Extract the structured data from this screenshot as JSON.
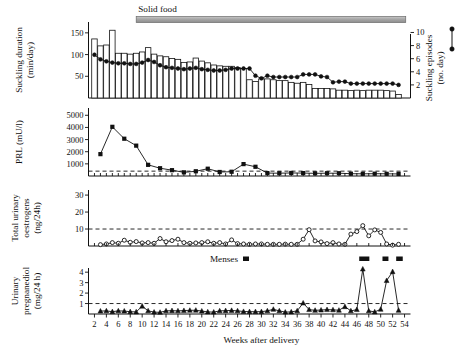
{
  "figure": {
    "xaxis": {
      "label": "Weeks after delivery",
      "ticks": [
        2,
        4,
        6,
        8,
        10,
        12,
        14,
        16,
        18,
        20,
        22,
        24,
        26,
        28,
        30,
        32,
        34,
        36,
        38,
        40,
        42,
        44,
        46,
        48,
        50,
        52,
        54
      ],
      "min": 1,
      "max": 55
    },
    "annotations": {
      "solid_food": "Solid food",
      "menses": "Menses",
      "menses_symbol": "filled-square"
    },
    "panels": [
      {
        "id": "suckling",
        "ylabel_lines": [
          "Suckling duration",
          "(min/day)"
        ],
        "yticks": [
          50,
          100,
          150
        ],
        "ylim": [
          0,
          175
        ],
        "right_ylabel_lines": [
          "Suckling episodes",
          "(no. day)"
        ],
        "right_yticks": [
          2,
          4,
          6,
          8,
          10
        ],
        "right_ylim": [
          0,
          11.6
        ]
      },
      {
        "id": "prl",
        "ylabel_lines": [
          "PRL (mU/l)"
        ],
        "yticks": [
          1000,
          2000,
          3000,
          4000,
          5000
        ],
        "ylim": [
          0,
          5600
        ],
        "threshold": 400
      },
      {
        "id": "oestrogens",
        "ylabel_lines": [
          "Total urinary",
          "oestrogens",
          "(ng/24h)"
        ],
        "yticks": [
          10,
          20,
          30
        ],
        "ylim": [
          0,
          33
        ],
        "threshold": 10
      },
      {
        "id": "pregnanediol",
        "ylabel_lines": [
          "Urinary",
          "pregnanediol",
          "(mg/24 h)"
        ],
        "yticks": [
          1,
          2,
          3,
          4
        ],
        "ylim": [
          0,
          4.4
        ],
        "threshold": 1
      }
    ]
  },
  "chart_data": [
    {
      "type": "bar",
      "title": "Suckling duration (min/day)",
      "xlabel": "Weeks after delivery",
      "ylabel": "Suckling duration (min/day)",
      "ylim": [
        0,
        175
      ],
      "x": [
        2,
        3,
        4,
        5,
        6,
        7,
        8,
        9,
        10,
        11,
        12,
        13,
        14,
        15,
        16,
        17,
        18,
        19,
        20,
        21,
        22,
        23,
        24,
        25,
        26,
        27,
        28,
        29,
        30,
        31,
        32,
        33,
        34,
        35,
        36,
        37,
        38,
        39,
        40,
        41,
        42,
        43,
        44,
        45,
        46,
        47,
        48,
        49,
        50,
        51,
        52,
        53
      ],
      "values": [
        136,
        120,
        122,
        156,
        103,
        103,
        101,
        103,
        106,
        116,
        101,
        97,
        95,
        91,
        89,
        82,
        83,
        92,
        85,
        81,
        76,
        74,
        73,
        73,
        70,
        68,
        42,
        38,
        44,
        44,
        42,
        40,
        40,
        36,
        34,
        36,
        31,
        22,
        22,
        22,
        21,
        18,
        18,
        17,
        18,
        17,
        18,
        18,
        18,
        17,
        16,
        8
      ]
    },
    {
      "type": "line",
      "title": "Suckling episodes (no./day)",
      "xlabel": "Weeks after delivery",
      "ylabel": "Suckling episodes (no. day)",
      "ylim": [
        0,
        11.6
      ],
      "x": [
        2,
        3,
        4,
        5,
        6,
        7,
        8,
        9,
        10,
        11,
        12,
        13,
        14,
        15,
        16,
        17,
        18,
        19,
        20,
        21,
        22,
        23,
        24,
        25,
        26,
        27,
        28,
        29,
        30,
        31,
        32,
        33,
        34,
        35,
        36,
        37,
        38,
        39,
        40,
        41,
        42,
        43,
        44,
        45,
        46,
        47,
        48,
        49,
        50,
        51,
        52,
        53
      ],
      "values": [
        6.6,
        5.9,
        5.6,
        5.4,
        5.3,
        5.3,
        5.2,
        5.2,
        5.4,
        5.8,
        5.5,
        5.0,
        4.7,
        4.6,
        4.5,
        4.4,
        4.5,
        4.6,
        4.4,
        4.3,
        4.2,
        4.2,
        4.3,
        4.5,
        4.5,
        4.5,
        4.5,
        3.4,
        3.0,
        3.4,
        3.2,
        3.2,
        3.2,
        3.2,
        3.2,
        3.6,
        3.6,
        3.6,
        3.3,
        3.2,
        2.4,
        2.5,
        2.5,
        2.2,
        2.2,
        2.2,
        2.2,
        2.2,
        2.2,
        2.2,
        2.2,
        2.0
      ]
    },
    {
      "type": "line",
      "title": "PRL (mU/l)",
      "xlabel": "Weeks after delivery",
      "ylabel": "PRL (mU/l)",
      "ylim": [
        0,
        5600
      ],
      "x": [
        3,
        5,
        7,
        9,
        11,
        13,
        15,
        17,
        19,
        21,
        23,
        25,
        27,
        29,
        31,
        33,
        35,
        37,
        39,
        41,
        43,
        45,
        47,
        49,
        51,
        53
      ],
      "values": [
        1800,
        4050,
        3070,
        2500,
        920,
        640,
        480,
        300,
        390,
        600,
        330,
        350,
        980,
        760,
        240,
        230,
        250,
        240,
        220,
        230,
        230,
        190,
        180,
        190,
        180,
        170
      ],
      "threshold": 400
    },
    {
      "type": "line",
      "title": "Total urinary oestrogens (ng/24h)",
      "xlabel": "Weeks after delivery",
      "ylabel": "Total urinary oestrogens (ng/24h)",
      "ylim": [
        0,
        33
      ],
      "x": [
        3,
        4,
        5,
        6,
        7,
        8,
        9,
        10,
        11,
        12,
        13,
        14,
        15,
        16,
        17,
        18,
        19,
        20,
        21,
        22,
        23,
        24,
        25,
        26,
        27,
        28,
        29,
        30,
        31,
        32,
        33,
        34,
        35,
        36,
        37,
        38,
        39,
        40,
        41,
        42,
        43,
        44,
        45,
        46,
        47,
        48,
        49,
        50,
        51,
        52,
        53
      ],
      "values": [
        0.8,
        1.2,
        2.0,
        1.6,
        3.4,
        2.2,
        2.6,
        1.8,
        2.0,
        1.6,
        4.4,
        2.5,
        3.2,
        4.0,
        2.0,
        1.6,
        1.8,
        2.0,
        2.5,
        1.6,
        2.0,
        1.2,
        3.6,
        1.4,
        1.2,
        1.0,
        1.2,
        1.2,
        1.0,
        1.0,
        1.0,
        1.1,
        1.0,
        1.0,
        4.0,
        9.6,
        3.0,
        2.4,
        1.4,
        2.0,
        1.2,
        1.0,
        7.0,
        8.5,
        12.0,
        6.0,
        9.5,
        8.0,
        1.2,
        0.5,
        1.0
      ],
      "threshold": 10,
      "marker": "open-circle"
    },
    {
      "type": "line",
      "title": "Urinary pregnanediol (mg/24 h)",
      "xlabel": "Weeks after delivery",
      "ylabel": "Urinary pregnanediol (mg/24 h)",
      "ylim": [
        0,
        4.4
      ],
      "x": [
        3,
        4,
        5,
        6,
        7,
        8,
        9,
        10,
        11,
        12,
        13,
        14,
        15,
        16,
        17,
        18,
        19,
        20,
        21,
        22,
        23,
        24,
        25,
        26,
        27,
        28,
        29,
        30,
        31,
        32,
        33,
        34,
        35,
        36,
        37,
        38,
        39,
        40,
        41,
        42,
        43,
        44,
        45,
        46,
        47,
        48,
        49,
        50,
        51,
        52,
        53
      ],
      "values": [
        0.28,
        0.3,
        0.22,
        0.3,
        0.28,
        0.22,
        0.2,
        0.75,
        0.3,
        0.18,
        0.16,
        0.3,
        0.32,
        0.3,
        0.33,
        0.35,
        0.36,
        0.28,
        0.2,
        0.18,
        0.3,
        0.32,
        0.34,
        0.3,
        0.24,
        0.22,
        0.22,
        0.22,
        0.3,
        0.45,
        0.3,
        0.18,
        0.2,
        0.3,
        1.05,
        0.42,
        0.35,
        0.38,
        0.42,
        0.4,
        0.36,
        0.7,
        0.3,
        0.42,
        4.3,
        0.3,
        0.2,
        0.45,
        3.2,
        4.05,
        0.35
      ],
      "threshold": 1,
      "marker": "filled-triangle"
    }
  ],
  "menses_bars": [
    {
      "start": 46.4,
      "end": 48.1
    },
    {
      "start": 50.3,
      "end": 51.3
    },
    {
      "start": 52.6,
      "end": 53.7
    }
  ],
  "solid_food_bar": {
    "start": 9.0,
    "end": 54.2
  }
}
